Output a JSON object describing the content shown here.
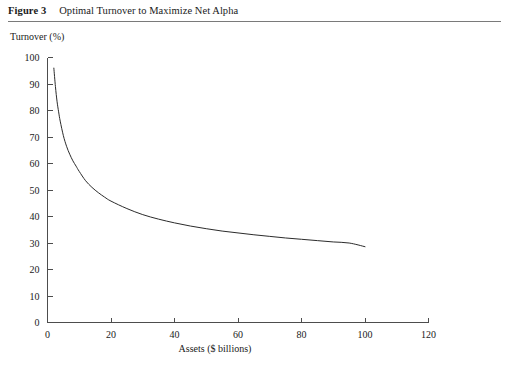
{
  "figure": {
    "label": "Figure 3",
    "caption": "Optimal Turnover to Maximize Net Alpha"
  },
  "chart_data": {
    "type": "line",
    "title": "Optimal Turnover to Maximize Net Alpha",
    "xlabel": "Assets ($ billions)",
    "ylabel": "Turnover (%)",
    "xlim": [
      0,
      120
    ],
    "ylim": [
      0,
      100
    ],
    "xticks": [
      0,
      20,
      40,
      60,
      80,
      100,
      120
    ],
    "yticks": [
      0,
      10,
      20,
      30,
      40,
      50,
      60,
      70,
      80,
      90,
      100
    ],
    "grid": false,
    "legend": false,
    "series": [
      {
        "name": "Optimal turnover",
        "x": [
          2,
          2.5,
          3,
          3.5,
          4,
          5,
          6,
          7,
          8,
          9,
          10,
          12,
          14,
          16,
          18,
          20,
          25,
          30,
          35,
          40,
          45,
          50,
          55,
          60,
          65,
          70,
          75,
          80,
          85,
          90,
          95,
          100
        ],
        "y": [
          96,
          89,
          83.5,
          79.5,
          76,
          70.5,
          66.5,
          63.5,
          61,
          59,
          57,
          53.5,
          51,
          49,
          47.3,
          45.8,
          43,
          40.7,
          39,
          37.6,
          36.4,
          35.4,
          34.5,
          33.8,
          33.1,
          32.5,
          31.9,
          31.4,
          30.9,
          30.4,
          30,
          28.6
        ]
      }
    ]
  }
}
